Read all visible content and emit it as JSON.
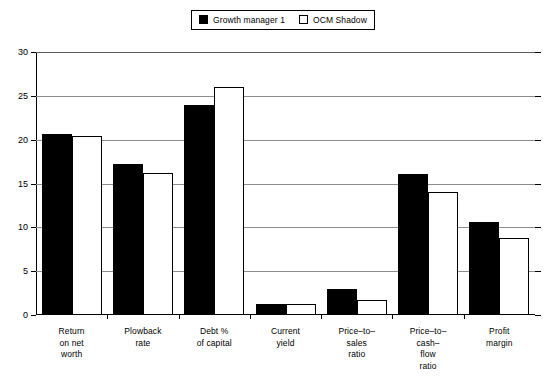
{
  "chart_data": {
    "type": "bar",
    "title": "",
    "subtitle": "",
    "xlabel": "",
    "ylabel": "",
    "ylim": [
      0,
      30
    ],
    "yticks": [
      0,
      5,
      10,
      15,
      20,
      25,
      30
    ],
    "grid": true,
    "legend_position": "top-center",
    "categories": [
      "Return\non net\nworth",
      "Plowback\nrate",
      "Debt %\nof capital",
      "Current\nyield",
      "Price–to–\nsales\nratio",
      "Price–to–\ncash–\nflow\nratio",
      "Profit\nmargin"
    ],
    "category_lines": [
      [
        "Return",
        "on net",
        "worth"
      ],
      [
        "Plowback",
        "rate"
      ],
      [
        "Debt %",
        "of capital"
      ],
      [
        "Current",
        "yield"
      ],
      [
        "Price–to–",
        "sales",
        "ratio"
      ],
      [
        "Price–to–",
        "cash–",
        "flow",
        "ratio"
      ],
      [
        "Profit",
        "margin"
      ]
    ],
    "series": [
      {
        "name": "Growth manager 1",
        "color": "#000000",
        "style": "filled",
        "values": [
          20.6,
          17.2,
          24.0,
          1.3,
          3.0,
          16.1,
          10.6
        ]
      },
      {
        "name": "OCM Shadow",
        "color": "#ffffff",
        "style": "hollow",
        "values": [
          20.4,
          16.2,
          26.0,
          1.3,
          1.7,
          14.0,
          8.8
        ]
      }
    ]
  },
  "legend": {
    "entries": [
      {
        "label": "Growth manager 1",
        "swatch": "filled-square-icon"
      },
      {
        "label": "OCM Shadow",
        "swatch": "hollow-square-icon"
      }
    ]
  },
  "axis": {
    "y_tick_labels": [
      "0",
      "5",
      "10",
      "15",
      "20",
      "25",
      "30"
    ]
  }
}
